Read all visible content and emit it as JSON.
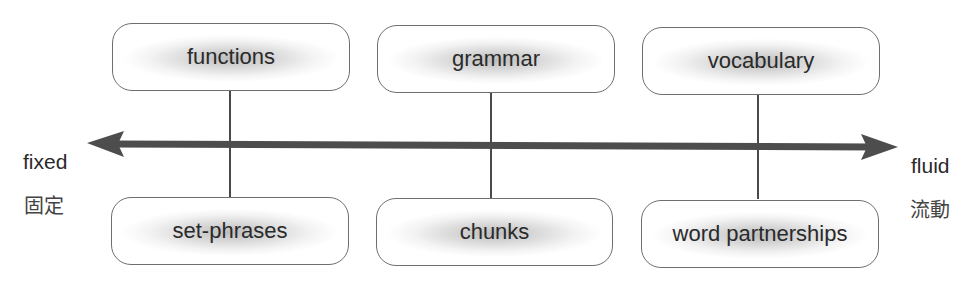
{
  "diagram": {
    "top_row": [
      {
        "label": "functions"
      },
      {
        "label": "grammar"
      },
      {
        "label": "vocabulary"
      }
    ],
    "bottom_row": [
      {
        "label": "set-phrases"
      },
      {
        "label": "chunks"
      },
      {
        "label": "word partnerships"
      }
    ],
    "axis": {
      "left_label": "fixed",
      "left_label_cjk": "固定",
      "right_label": "fluid",
      "right_label_cjk": "流動",
      "arrow_color": "#4d4d4d",
      "direction": "bidirectional"
    }
  }
}
